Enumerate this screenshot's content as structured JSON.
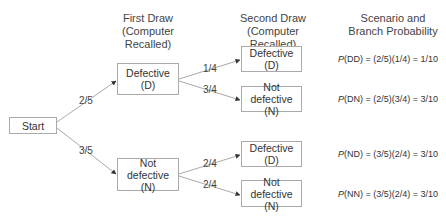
{
  "headers": {
    "first_draw": [
      "First Draw",
      "(Computer Recalled)"
    ],
    "second_draw": [
      "Second Draw",
      "(Computer Recalled)"
    ],
    "scenario": [
      "Scenario and",
      "Branch Probability"
    ]
  },
  "nodes": {
    "start": "Start",
    "first_d": [
      "Defective",
      "(D)"
    ],
    "first_n": [
      "Not defective",
      "(N)"
    ],
    "dd": [
      "Defective",
      "(D)"
    ],
    "dn": [
      "Not defective",
      "(N)"
    ],
    "nd": [
      "Defective",
      "(D)"
    ],
    "nn": [
      "Not defective",
      "(N)"
    ]
  },
  "branch_labels": {
    "start_to_d": "2/5",
    "start_to_n": "3/5",
    "d_to_d": "1/4",
    "d_to_n": "3/4",
    "n_to_d": "2/4",
    "n_to_n": "2/4"
  },
  "probabilities": [
    {
      "p": "P",
      "rest": "(DD) = (2/5)(1/4) = 1/10"
    },
    {
      "p": "P",
      "rest": "(DN) = (2/5)(3/4) = 3/10"
    },
    {
      "p": "P",
      "rest": "(ND) = (3/5)(2/4) = 3/10"
    },
    {
      "p": "P",
      "rest": "(NN) = (3/5)(2/4) = 3/10"
    }
  ],
  "colors": {
    "line": "#aaaaaa",
    "arrow": "#333333",
    "text": "#333333"
  }
}
